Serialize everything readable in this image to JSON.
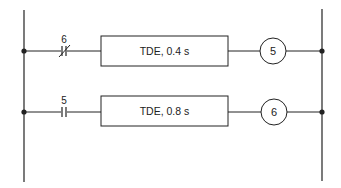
{
  "diagram": {
    "type": "ladder-logic",
    "rails": {
      "left": {
        "x": 24,
        "y1": 10,
        "y2": 182
      },
      "right": {
        "x": 322,
        "y1": 9,
        "y2": 181
      }
    },
    "rungs": [
      {
        "y": 51,
        "contact": {
          "label": "6",
          "type": "normally-closed",
          "x": 64
        },
        "block": {
          "label": "TDE, 0.4 s",
          "x": 101,
          "w": 127,
          "h": 30
        },
        "coil": {
          "label": "5",
          "cx": 273,
          "r": 13
        }
      },
      {
        "y": 112,
        "contact": {
          "label": "5",
          "type": "normally-open",
          "x": 64
        },
        "block": {
          "label": "TDE, 0.8 s",
          "x": 101,
          "w": 127,
          "h": 30
        },
        "coil": {
          "label": "6",
          "cx": 273,
          "r": 13
        }
      }
    ],
    "colors": {
      "line": "#222222",
      "background": "#ffffff"
    }
  }
}
